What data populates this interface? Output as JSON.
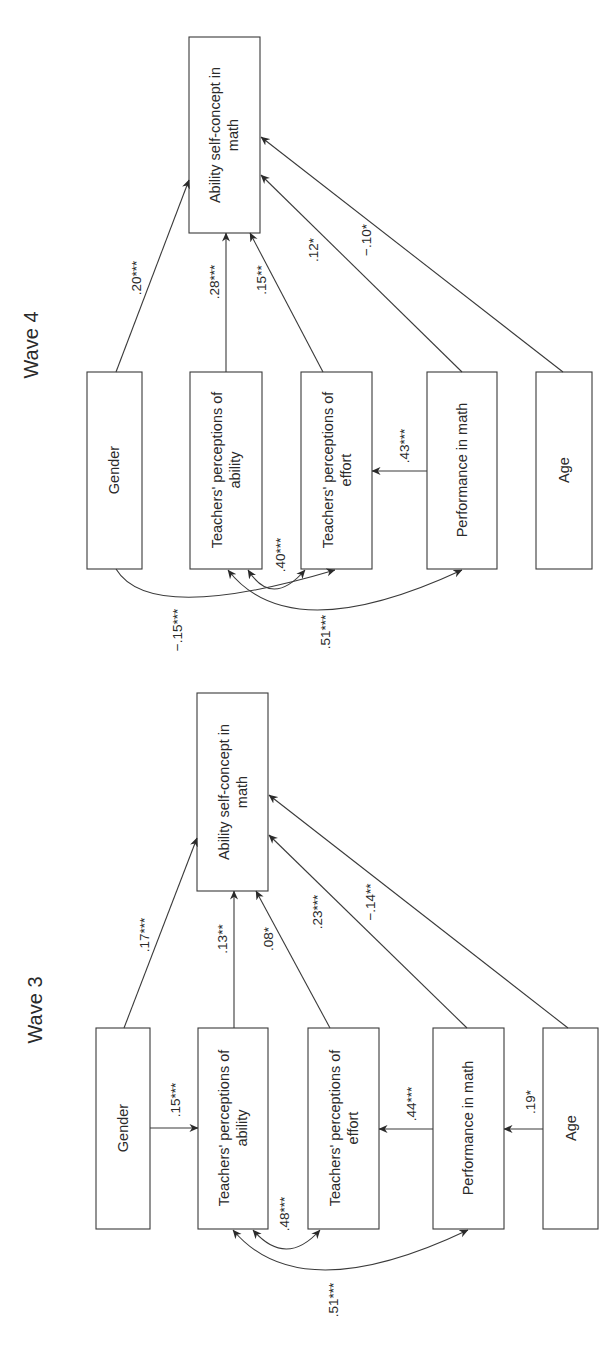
{
  "figure": {
    "orientation": "rotated-90-ccw",
    "colors": {
      "background": "#ffffff",
      "stroke": "#3a3a3a",
      "text": "#2a2a2a"
    }
  },
  "panels": [
    {
      "id": "wave4",
      "title": "Wave 4",
      "nodes": {
        "asc": {
          "line1": "Ability self-concept in",
          "line2": "math"
        },
        "gender": {
          "line1": "Gender"
        },
        "ability": {
          "line1": "Teachers' perceptions of",
          "line2": "ability"
        },
        "effort": {
          "line1": "Teachers' perceptions of",
          "line2": "effort"
        },
        "perf": {
          "line1": "Performance in math"
        },
        "age": {
          "line1": "Age"
        }
      },
      "paths": {
        "gender_asc": ".20***",
        "ability_asc": ".28***",
        "effort_asc": ".15**",
        "perf_asc": ".12*",
        "age_asc": "−.10*",
        "perf_effort": ".43***"
      },
      "correlations": {
        "ability_effort": ".40***",
        "gender_effort": "−.15***",
        "ability_perf": ".51***"
      }
    },
    {
      "id": "wave3",
      "title": "Wave 3",
      "nodes": {
        "asc": {
          "line1": "Ability self-concept in",
          "line2": "math"
        },
        "gender": {
          "line1": "Gender"
        },
        "ability": {
          "line1": "Teachers' perceptions of",
          "line2": "ability"
        },
        "effort": {
          "line1": "Teachers' perceptions of",
          "line2": "effort"
        },
        "perf": {
          "line1": "Performance in math"
        },
        "age": {
          "line1": "Age"
        }
      },
      "paths": {
        "gender_asc": ".17***",
        "ability_asc": ".13**",
        "effort_asc": ".08*",
        "perf_asc": ".23***",
        "age_asc": "−.14**",
        "gender_ability": ".15***",
        "perf_effort": ".44***",
        "age_perf": ".19*"
      },
      "correlations": {
        "ability_effort": ".48***",
        "ability_perf": ".51***"
      }
    }
  ]
}
